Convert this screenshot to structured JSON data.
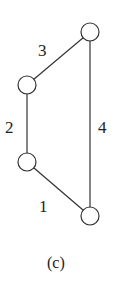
{
  "diagram": {
    "caption": "(c)",
    "nodes": [
      {
        "id": "top-right"
      },
      {
        "id": "upper-left"
      },
      {
        "id": "lower-left"
      },
      {
        "id": "bottom-right"
      }
    ],
    "edges": [
      {
        "label": "1",
        "from": "lower-left",
        "to": "bottom-right"
      },
      {
        "label": "2",
        "from": "upper-left",
        "to": "lower-left"
      },
      {
        "label": "3",
        "from": "upper-left",
        "to": "top-right"
      },
      {
        "label": "4",
        "from": "top-right",
        "to": "bottom-right"
      }
    ]
  }
}
